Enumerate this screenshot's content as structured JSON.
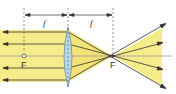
{
  "diagram": {
    "title": "",
    "type": "converging-lens-ray-diagram",
    "labels": {
      "focal_length_left": "f",
      "focal_length_right": "f",
      "focal_point_left": "F",
      "focal_point_right": "F"
    },
    "colors": {
      "beam": "#f7ec8a",
      "lens_fill": "#b9d7e6",
      "lens_stroke": "#6b8fa3",
      "ray": "#333333",
      "axis": "#9a9a9a"
    },
    "rays_count": 5
  }
}
